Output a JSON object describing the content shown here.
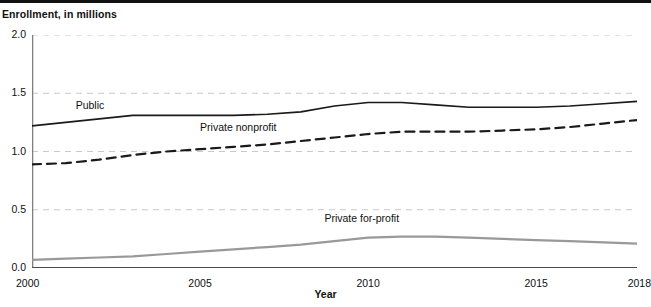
{
  "figure": {
    "y_axis_title": "Enrollment, in millions",
    "x_axis_title": "Year"
  },
  "chart_data": {
    "type": "line",
    "title": "",
    "subtitle": "",
    "xlabel": "Year",
    "ylabel": "Enrollment, in millions",
    "xlim": [
      2000,
      2018
    ],
    "ylim": [
      0.0,
      2.0
    ],
    "grid": "horizontal-dashed",
    "legend": "inline-labels",
    "y_ticks": [
      "0.0",
      "0.5",
      "1.0",
      "1.5",
      "2.0"
    ],
    "y_tick_values": [
      0.0,
      0.5,
      1.0,
      1.5,
      2.0
    ],
    "x_ticks": [
      "2000",
      "2005",
      "2010",
      "2015",
      "2018"
    ],
    "x_tick_values": [
      2000,
      2005,
      2010,
      2015,
      2018
    ],
    "x_minor_tick_interval": 1,
    "x": [
      2000,
      2001,
      2002,
      2003,
      2004,
      2005,
      2006,
      2007,
      2008,
      2009,
      2010,
      2011,
      2012,
      2013,
      2014,
      2015,
      2016,
      2017,
      2018
    ],
    "series": [
      {
        "name": "Public",
        "label": "Public",
        "style": "solid",
        "color": "#1a1a1a",
        "width": 1.6,
        "values": [
          1.22,
          1.25,
          1.28,
          1.31,
          1.31,
          1.31,
          1.31,
          1.32,
          1.34,
          1.39,
          1.42,
          1.42,
          1.4,
          1.38,
          1.38,
          1.38,
          1.39,
          1.41,
          1.43
        ],
        "label_x": 2001.3,
        "label_y": 1.39
      },
      {
        "name": "Private nonprofit",
        "label": "Private nonprofit",
        "style": "dashed",
        "color": "#1a1a1a",
        "width": 2.2,
        "dash": "9,6",
        "values": [
          0.89,
          0.9,
          0.93,
          0.97,
          1.0,
          1.02,
          1.04,
          1.06,
          1.09,
          1.12,
          1.15,
          1.17,
          1.17,
          1.17,
          1.18,
          1.19,
          1.21,
          1.24,
          1.27
        ],
        "label_x": 2005.0,
        "label_y": 1.2
      },
      {
        "name": "Private for-profit",
        "label": "Private for-profit",
        "style": "solid",
        "color": "#999999",
        "width": 2.2,
        "values": [
          0.07,
          0.08,
          0.09,
          0.1,
          0.12,
          0.14,
          0.16,
          0.18,
          0.2,
          0.23,
          0.26,
          0.27,
          0.27,
          0.26,
          0.25,
          0.24,
          0.23,
          0.22,
          0.21
        ],
        "label_x": 2008.7,
        "label_y": 0.42
      }
    ]
  }
}
